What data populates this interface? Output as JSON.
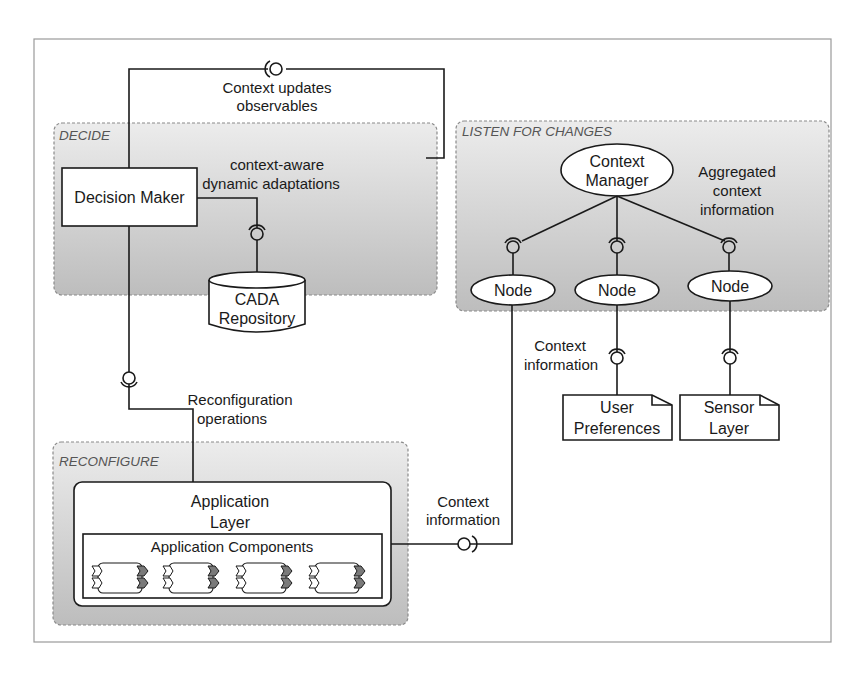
{
  "diagram": {
    "regions": {
      "decide": "DECIDE",
      "listen": "LISTEN FOR CHANGES",
      "reconfigure": "RECONFIGURE"
    },
    "components": {
      "decision_maker": "Decision Maker",
      "cada_line1": "CADA",
      "cada_line2": "Repository",
      "context_manager_line1": "Context",
      "context_manager_line2": "Manager",
      "node_1": "Node",
      "node_2": "Node",
      "node_3": "Node",
      "user_pref_line1": "User",
      "user_pref_line2": "Preferences",
      "sensor_line1": "Sensor",
      "sensor_line2": "Layer",
      "app_layer_line1": "Application",
      "app_layer_line2": "Layer",
      "app_components": "Application Components"
    },
    "connectors": {
      "context_updates_line1": "Context updates",
      "context_updates_line2": "observables",
      "cada_line1": "context-aware",
      "cada_line2": "dynamic adaptations",
      "aggregated_line1": "Aggregated",
      "aggregated_line2": "context",
      "aggregated_line3": "information",
      "context_info_mid_line1": "Context",
      "context_info_mid_line2": "information",
      "reconfig_line1": "Reconfiguration",
      "reconfig_line2": "operations",
      "context_info_bottom_line1": "Context",
      "context_info_bottom_line2": "information"
    },
    "component_instances": 4
  }
}
